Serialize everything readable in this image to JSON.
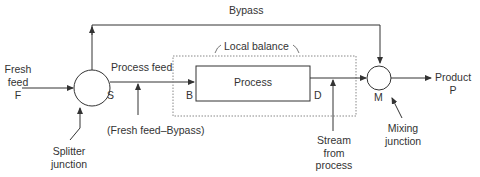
{
  "diagram": {
    "nodes": {
      "splitter": {
        "letter": "S",
        "label_line1": "Splitter",
        "label_line2": "junction"
      },
      "mixer": {
        "letter": "M",
        "label_line1": "Mixing",
        "label_line2": "junction"
      },
      "process": {
        "label": "Process",
        "inlet": "B",
        "outlet": "D"
      },
      "local_balance": {
        "label": "Local balance"
      }
    },
    "streams": {
      "fresh_feed": {
        "line1": "Fresh",
        "line2": "feed",
        "line3": "F"
      },
      "bypass": {
        "label": "Bypass"
      },
      "process_feed": {
        "label": "Process feed"
      },
      "process_feed_note": {
        "label": "(Fresh feed–Bypass)"
      },
      "stream_from_process": {
        "line1": "Stream",
        "line2": "from",
        "line3": "process"
      },
      "product": {
        "line1": "Product",
        "line2": "P"
      }
    },
    "colors": {
      "line": "#333333",
      "dotted": "#888888",
      "text": "#333333"
    }
  }
}
